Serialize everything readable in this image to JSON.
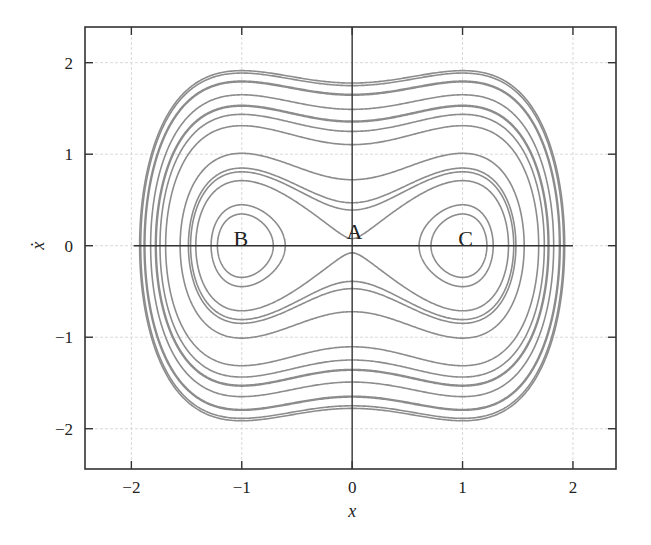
{
  "chart_data": {
    "type": "line",
    "title": "",
    "xlabel": "x",
    "ylabel": "ẋ",
    "xlim": [
      -2.42,
      2.39
    ],
    "ylim": [
      -2.44,
      2.39
    ],
    "xticks": [
      -2,
      -1,
      0,
      1,
      2
    ],
    "yticks": [
      -2,
      -1,
      0,
      1,
      2
    ],
    "xtick_labels": [
      "−2",
      "−1",
      "0",
      "1",
      "2"
    ],
    "ytick_labels": [
      "−2",
      "−1",
      "0",
      "1",
      "2"
    ],
    "grid": true,
    "legend": null,
    "annotations": [
      {
        "text": "A",
        "x": 0,
        "y": 0,
        "role": "saddle point"
      },
      {
        "text": "B",
        "x": -1,
        "y": 0,
        "role": "center"
      },
      {
        "text": "C",
        "x": 1,
        "y": 0,
        "role": "center"
      }
    ],
    "outer_orbit_energies": [
      1.58,
      1.53,
      1.36,
      1.11,
      0.92,
      0.78,
      0.61,
      0.26,
      0.11,
      0.076,
      0.003
    ],
    "outer_orbit_xdot_at_x0": [
      1.78,
      1.75,
      1.65,
      1.49,
      1.36,
      1.25,
      1.1,
      0.72,
      0.47,
      0.39,
      0.07
    ],
    "inner_orbit_energies": [
      -0.15,
      -0.19
    ],
    "inner_orbit_x_crossings_C": [
      [
        0.6,
        1.27
      ],
      [
        0.69,
        1.19
      ]
    ],
    "inner_orbit_x_crossings_B": [
      [
        -1.27,
        -0.6
      ],
      [
        -1.19,
        -0.69
      ]
    ],
    "line_color": "#8c8c8c",
    "axis_color": "#333333",
    "grid_color": "#d9d9d9"
  }
}
